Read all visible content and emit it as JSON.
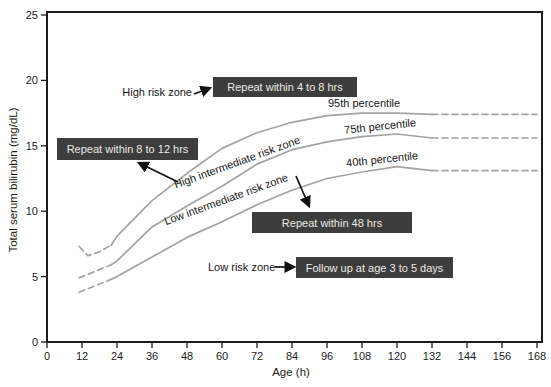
{
  "figure": {
    "width": 551,
    "height": 387,
    "background": "#ffffff"
  },
  "colors": {
    "curve": "#a3a3a3",
    "axis": "#1c1c1c",
    "annotation_box_bg": "#3d3d3d",
    "annotation_box_text": "#eceae6",
    "arrow": "#111111"
  },
  "chart_data": {
    "type": "line",
    "title": "",
    "xlabel": "Age (h)",
    "ylabel": "Total serum bilirubin (mg/dL)",
    "xlim": [
      0,
      170
    ],
    "ylim": [
      0,
      25
    ],
    "x_ticks": [
      0,
      12,
      24,
      36,
      48,
      60,
      72,
      84,
      96,
      108,
      120,
      132,
      144,
      156,
      168
    ],
    "y_ticks": [
      0,
      5,
      10,
      15,
      20,
      25
    ],
    "grid": false,
    "legend_position": "none",
    "series": [
      {
        "name": "95th percentile",
        "x": [
          11,
          14,
          18,
          22,
          24,
          36,
          48,
          60,
          72,
          84,
          96,
          108,
          120,
          132,
          144,
          156,
          168
        ],
        "y": [
          7.3,
          6.6,
          6.9,
          7.4,
          8.1,
          10.8,
          12.9,
          14.8,
          16.0,
          16.8,
          17.3,
          17.5,
          17.5,
          17.4,
          17.4,
          17.4,
          17.4
        ],
        "dashed_before_h": 22,
        "dashed_after_h": 132
      },
      {
        "name": "75th percentile",
        "x": [
          11,
          22,
          24,
          36,
          48,
          60,
          72,
          84,
          96,
          108,
          120,
          132,
          144,
          156,
          168
        ],
        "y": [
          4.9,
          5.9,
          6.2,
          8.8,
          10.4,
          11.9,
          13.6,
          14.7,
          15.3,
          15.7,
          15.9,
          15.6,
          15.6,
          15.6,
          15.6
        ],
        "dashed_before_h": 22,
        "dashed_after_h": 132
      },
      {
        "name": "40th percentile",
        "x": [
          11,
          21,
          24,
          36,
          48,
          60,
          72,
          84,
          96,
          108,
          120,
          132,
          144,
          156,
          168
        ],
        "y": [
          3.8,
          4.7,
          5.0,
          6.5,
          8.0,
          9.2,
          10.5,
          11.6,
          12.5,
          13.0,
          13.4,
          13.1,
          13.1,
          13.1,
          13.1
        ],
        "dashed_before_h": 21,
        "dashed_after_h": 132
      }
    ]
  },
  "axis_titles": {
    "y": "Total serum bilirubin (mg/dL)",
    "x": "Age (h)"
  },
  "percentile_labels": {
    "p95": "95th percentile",
    "p75": "75th percentile",
    "p40": "40th percentile"
  },
  "zone_labels": {
    "high_risk": "High risk zone",
    "high_intermediate": "High intermediate risk zone",
    "low_intermediate": "Low intermediate risk zone",
    "low_risk": "Low risk zone"
  },
  "annotation_boxes": {
    "repeat_4_8": "Repeat within 4 to 8 hrs",
    "repeat_8_12": "Repeat within 8 to 12 hrs",
    "repeat_48": "Repeat within 48 hrs",
    "follow_up": "Follow up at age 3 to 5 days"
  },
  "arrows": [
    {
      "name": "high-risk-zone-arrow",
      "x1": 194,
      "y1": 94,
      "x2": 210,
      "y2": 88
    },
    {
      "name": "repeat-8-12-arrow",
      "x1": 178,
      "y1": 182,
      "x2": 139,
      "y2": 163
    },
    {
      "name": "repeat-48-arrow",
      "x1": 296,
      "y1": 176,
      "x2": 309,
      "y2": 206
    },
    {
      "name": "low-risk-zone-arrow",
      "x1": 275,
      "y1": 267,
      "x2": 294,
      "y2": 267
    }
  ],
  "plot_area": {
    "left": 47,
    "right": 537,
    "top": 15,
    "bottom": 342,
    "frame_top": 12,
    "frame_right": 542
  }
}
